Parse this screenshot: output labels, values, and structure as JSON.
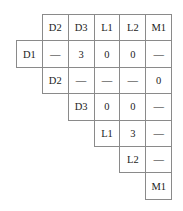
{
  "matrix": {
    "column_headers": [
      "D2",
      "D3",
      "L1",
      "L2",
      "M1"
    ],
    "rows": [
      {
        "label": "D1",
        "values": [
          "—",
          "3",
          "0",
          "0",
          "—"
        ]
      },
      {
        "label": "D2",
        "values": [
          "—",
          "—",
          "—",
          "0"
        ]
      },
      {
        "label": "D3",
        "values": [
          "0",
          "0",
          "—"
        ]
      },
      {
        "label": "L1",
        "values": [
          "3",
          "—"
        ]
      },
      {
        "label": "L2",
        "values": [
          "—"
        ]
      },
      {
        "label": "M1",
        "values": []
      }
    ]
  }
}
